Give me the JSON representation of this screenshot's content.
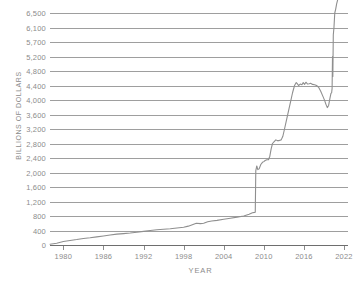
{
  "chart_data": {
    "type": "line",
    "title": "",
    "xlabel": "YEAR",
    "ylabel": "BILLIONS OF DOLLARS",
    "grid": true,
    "legend": "none",
    "xlim": [
      1978,
      2022.6
    ],
    "ylim": [
      0,
      6500
    ],
    "xticks": [
      1980,
      1986,
      1992,
      1998,
      2004,
      2010,
      2016,
      2022
    ],
    "xtick_labels": [
      "1980",
      "1986",
      "1992",
      "1998",
      "2004",
      "2010",
      "2016",
      "2022"
    ],
    "yticks": [
      0,
      400,
      800,
      1200,
      1600,
      2000,
      2400,
      2800,
      3200,
      3600,
      4000,
      4400,
      4800,
      5200,
      5700,
      6100,
      6500
    ],
    "ytick_labels": [
      "0",
      "400",
      "800",
      "1,200",
      "1,600",
      "2,000",
      "2,400",
      "2,800",
      "3,200",
      "3,600",
      "4,000",
      "4,400",
      "4,800",
      "5,200",
      "5,700",
      "6,100",
      "6,500"
    ],
    "line_color": "#8f8f8f",
    "grid_color": "#9e9e9e",
    "text_color": "#8c8c8c",
    "background_color": "#ffffff",
    "series": [
      {
        "name": "Total",
        "x": [
          1978.0,
          1979.0,
          1980.0,
          1981.0,
          1982.0,
          1983.0,
          1984.0,
          1985.0,
          1986.0,
          1987.0,
          1988.0,
          1989.0,
          1990.0,
          1991.0,
          1992.0,
          1993.0,
          1994.0,
          1995.0,
          1996.0,
          1997.0,
          1998.0,
          1998.7,
          1999.3,
          1999.9,
          2000.5,
          2001.0,
          2001.6,
          2002.2,
          2003.0,
          2004.0,
          2005.0,
          2006.0,
          2007.0,
          2007.8,
          2008.3,
          2008.62,
          2008.72,
          2008.8,
          2008.95,
          2009.1,
          2009.3,
          2009.55,
          2009.8,
          2010.0,
          2010.2,
          2010.45,
          2010.7,
          2010.9,
          2011.1,
          2011.3,
          2011.55,
          2011.8,
          2012.0,
          2012.3,
          2012.6,
          2012.85,
          2013.1,
          2013.4,
          2013.7,
          2014.0,
          2014.3,
          2014.6,
          2014.85,
          2015.0,
          2015.2,
          2015.45,
          2015.7,
          2015.9,
          2016.1,
          2016.3,
          2016.55,
          2016.8,
          2017.0,
          2017.3,
          2017.6,
          2017.9,
          2018.2,
          2018.5,
          2018.8,
          2019.1,
          2019.3,
          2019.5,
          2019.7,
          2019.9,
          2020.05,
          2020.15,
          2020.22,
          2020.28,
          2020.33,
          2020.4,
          2020.5,
          2020.62,
          2020.75,
          2020.9,
          2021.1,
          2021.3,
          2021.5,
          2021.7,
          2021.9,
          2022.05,
          2022.2,
          2022.35,
          2022.5
        ],
        "y": [
          20,
          50,
          95,
          125,
          150,
          180,
          200,
          225,
          250,
          275,
          300,
          315,
          330,
          350,
          375,
          400,
          420,
          435,
          450,
          470,
          490,
          520,
          560,
          600,
          590,
          600,
          640,
          660,
          680,
          710,
          740,
          770,
          800,
          850,
          890,
          900,
          905,
          2050,
          2180,
          2080,
          2100,
          2220,
          2280,
          2300,
          2330,
          2350,
          2350,
          2450,
          2650,
          2800,
          2850,
          2900,
          2880,
          2880,
          2900,
          3000,
          3200,
          3450,
          3700,
          3950,
          4200,
          4400,
          4480,
          4450,
          4400,
          4440,
          4420,
          4480,
          4430,
          4490,
          4440,
          4450,
          4460,
          4430,
          4420,
          4400,
          4350,
          4250,
          4120,
          3990,
          3880,
          3790,
          3850,
          4050,
          4180,
          4200,
          4320,
          5200,
          4650,
          5900,
          6100,
          6500,
          6600,
          6750,
          6900,
          7050,
          7250,
          7400,
          7550,
          7600,
          7500,
          7380,
          7300
        ]
      }
    ],
    "annotations": []
  }
}
